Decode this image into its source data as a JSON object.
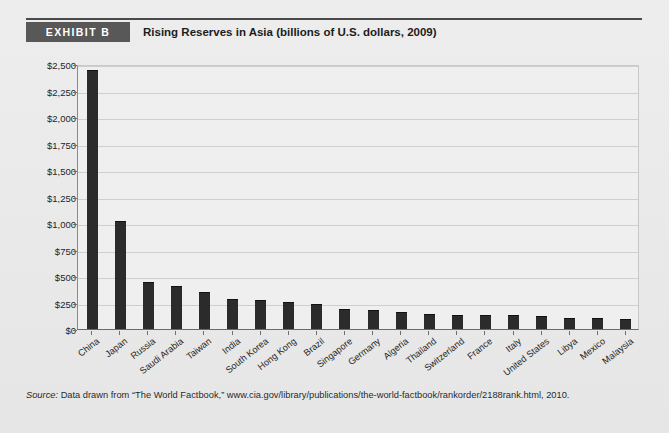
{
  "header": {
    "badge_label": "EXHIBIT B",
    "title": "Rising Reserves in Asia (billions of U.S. dollars, 2009)"
  },
  "source": {
    "prefix": "Source:",
    "text": " Data drawn from “The World Factbook,” www.cia.gov/library/publications/the-world-factbook/rankorder/2188rank.html, 2010."
  },
  "colors": {
    "bar": "#2b2b2b",
    "badge_bg": "#585858",
    "page_bg": "#e9e9e9",
    "plot_bg": "#efefef",
    "grid": "#cfcfcf",
    "rule": "#4a4a4a"
  },
  "chart_data": {
    "type": "bar",
    "title": "Rising Reserves in Asia (billions of U.S. dollars, 2009)",
    "xlabel": "",
    "ylabel": "",
    "ylim": [
      0,
      2500
    ],
    "ytick_values": [
      0,
      250,
      500,
      750,
      1000,
      1250,
      1500,
      1750,
      2000,
      2250,
      2500
    ],
    "ytick_labels": [
      "$0",
      "$250",
      "$500",
      "$750",
      "$1,000",
      "$1,250",
      "$1,500",
      "$1,750",
      "$2,000",
      "$2,250",
      "$2,500"
    ],
    "grid": true,
    "legend": false,
    "categories": [
      "China",
      "Japan",
      "Russia",
      "Saudi Arabia",
      "Taiwan",
      "India",
      "South Korea",
      "Hong Kong",
      "Brazil",
      "Singapore",
      "Germany",
      "Algeria",
      "Thailand",
      "Switzerland",
      "France",
      "Italy",
      "United States",
      "Libya",
      "Mexico",
      "Malaysia"
    ],
    "values": [
      2440,
      1020,
      439,
      410,
      348,
      285,
      270,
      256,
      239,
      188,
      181,
      162,
      138,
      135,
      133,
      132,
      124,
      105,
      100,
      96
    ]
  }
}
